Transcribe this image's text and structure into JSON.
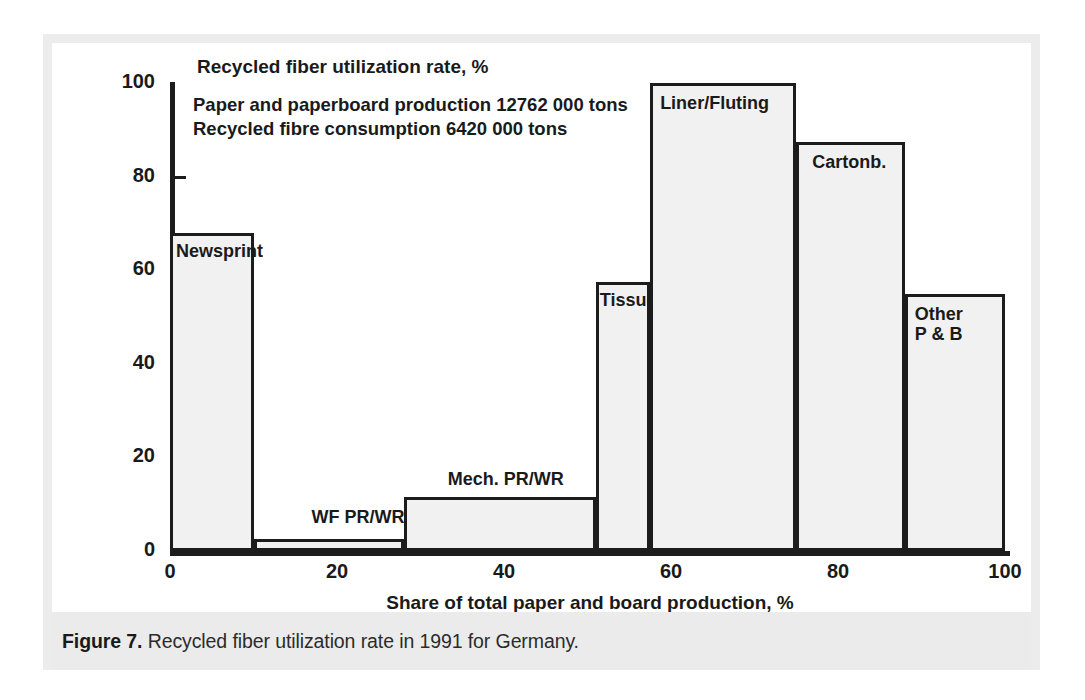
{
  "caption": {
    "figure_label": "Figure 7.",
    "text": " Recycled fiber utilization rate in 1991 for Germany."
  },
  "annotation": {
    "line1": "Paper and paperboard production 12762 000 tons",
    "line2": "Recycled fibre consumption 6420 000 tons"
  },
  "colors": {
    "axis": "#1c1c1c",
    "bar_fill": "#f1f1f1",
    "bar_stroke": "#1c1c1c",
    "frame": "#ececec",
    "caption_band": "#ebebeb"
  },
  "chart_data": {
    "type": "bar",
    "title": "Recycled  fiber utilization rate, %",
    "xlabel": "Share of total paper and board production, %",
    "ylabel": "Recycled  fiber utilization rate, %",
    "xlim": [
      0,
      100
    ],
    "ylim": [
      0,
      100
    ],
    "grid": false,
    "legend": "none",
    "variable_width_bars": true,
    "xticks": [
      0,
      20,
      40,
      60,
      80,
      100
    ],
    "xtick_labels": [
      "0",
      "20",
      "40",
      "60",
      "80",
      "100"
    ],
    "yticks": [
      0,
      20,
      40,
      60,
      80,
      100
    ],
    "ytick_labels": [
      "0",
      "20",
      "40",
      "60",
      "80",
      "100"
    ],
    "categories": [
      "Newsprint",
      "WF PR/WR",
      "Mech. PR/WR",
      "Tissue",
      "Liner/Fluting",
      "Cartonb.",
      "Other P & B"
    ],
    "values": [
      68,
      2.5,
      11.5,
      57.5,
      100,
      87.5,
      55
    ],
    "bars": [
      {
        "label": "Newsprint",
        "x_start": 0,
        "x_end": 10,
        "value": 68
      },
      {
        "label": "WF PR/WR",
        "x_start": 10,
        "x_end": 28,
        "value": 2.5
      },
      {
        "label": "Mech. PR/WR",
        "x_start": 28,
        "x_end": 51,
        "value": 11.5
      },
      {
        "label": "Tissue",
        "x_start": 51,
        "x_end": 57.5,
        "value": 57.5
      },
      {
        "label": "Liner/Fluting",
        "x_start": 57.5,
        "x_end": 75,
        "value": 100
      },
      {
        "label": "Cartonb.",
        "x_start": 75,
        "x_end": 88,
        "value": 87.5
      },
      {
        "label": "Other\nP & B",
        "x_start": 88,
        "x_end": 100,
        "value": 55
      }
    ],
    "annotations": [
      "Paper and paperboard production 12762 000 tons",
      "Recycled fibre consumption 6420 000 tons"
    ]
  }
}
